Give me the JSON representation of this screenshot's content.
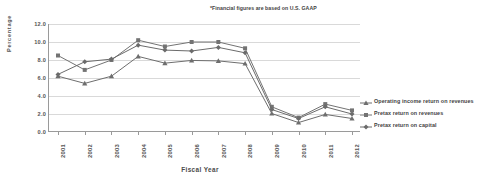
{
  "chart_data": {
    "type": "line",
    "title": "",
    "annotation": "*Financial figures are based on U.S. GAAP",
    "xlabel": "Fiscal Year",
    "ylabel": "Percentage",
    "categories": [
      "2001",
      "2002",
      "2003",
      "2004",
      "2005",
      "2006",
      "2007",
      "2008",
      "2009",
      "2010",
      "2011",
      "2012"
    ],
    "ylim": [
      0.0,
      12.0
    ],
    "yticks": [
      "0.0",
      "2.0",
      "4.0",
      "6.0",
      "8.0",
      "10.0",
      "12.0"
    ],
    "ytick_values": [
      0.0,
      2.0,
      4.0,
      6.0,
      8.0,
      10.0,
      12.0
    ],
    "grid": true,
    "legend_position": "right",
    "series": [
      {
        "name": "Operating income return on revenues",
        "marker": "cross",
        "color": "#6e6e6e",
        "values": [
          6.2,
          5.4,
          6.2,
          8.4,
          7.65,
          7.95,
          7.9,
          7.6,
          2.05,
          1.05,
          1.95,
          1.5
        ]
      },
      {
        "name": "Pretax return on revenues",
        "marker": "square",
        "color": "#737373",
        "values": [
          8.5,
          6.9,
          8.0,
          10.2,
          9.5,
          10.0,
          10.0,
          9.3,
          2.8,
          1.6,
          3.1,
          2.4
        ]
      },
      {
        "name": "Pretax return on capital",
        "marker": "diamond",
        "color": "#6b6b6b",
        "values": [
          6.4,
          7.8,
          8.1,
          9.65,
          9.1,
          9.0,
          9.4,
          8.8,
          2.5,
          1.5,
          2.8,
          2.0
        ]
      }
    ]
  }
}
